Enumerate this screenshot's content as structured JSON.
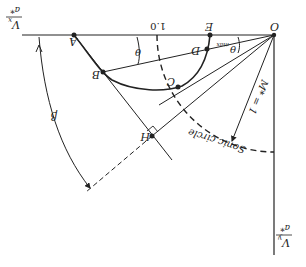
{
  "diagram": {
    "orientation": "rotated-180",
    "axes": {
      "x_label_num": "V",
      "x_label_sub": "x",
      "x_label_den": "a*",
      "y_label_num": "V",
      "y_label_sub": "y",
      "y_label_den": "a*"
    },
    "points": {
      "O": "O",
      "A": "A",
      "B": "B",
      "C": "C",
      "D": "D",
      "E": "E",
      "H": "H"
    },
    "tick_label": "1.0",
    "angles": {
      "theta": "θ",
      "theta_max": "θ",
      "theta_max_sub": "max",
      "beta": "β"
    },
    "annotations": {
      "mach_line": "M* = 1",
      "sonic_circle": "Sonic circle"
    },
    "colors": {
      "line": "#222222",
      "background": "#ffffff"
    }
  }
}
